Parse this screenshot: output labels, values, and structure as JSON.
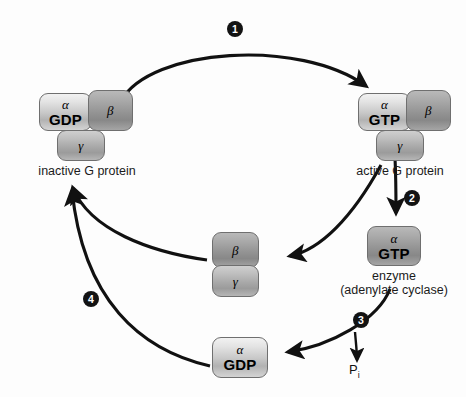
{
  "diagram": {
    "background_color": "#fdfdfd",
    "badge_color": "#131313",
    "badge_text_color": "#ffffff",
    "arrow_color": "#111111"
  },
  "complexes": {
    "inactive": {
      "caption": "inactive G protein",
      "alpha_greek": "α",
      "alpha_nucleotide": "GDP",
      "beta_greek": "β",
      "gamma_greek": "γ"
    },
    "active": {
      "caption": "active G protein",
      "alpha_greek": "α",
      "alpha_nucleotide": "GTP",
      "beta_greek": "β",
      "gamma_greek": "γ"
    },
    "betagamma": {
      "beta_greek": "β",
      "gamma_greek": "γ"
    },
    "alpha_gtp": {
      "greek": "α",
      "nucleotide": "GTP",
      "caption_line1": "enzyme",
      "caption_line2": "(adenylate cyclase)"
    },
    "alpha_gdp": {
      "greek": "α",
      "nucleotide": "GDP"
    }
  },
  "phosphate": {
    "symbol": "P",
    "subscript": "i"
  },
  "steps": [
    {
      "number": "1"
    },
    {
      "number": "2"
    },
    {
      "number": "3"
    },
    {
      "number": "4"
    }
  ]
}
